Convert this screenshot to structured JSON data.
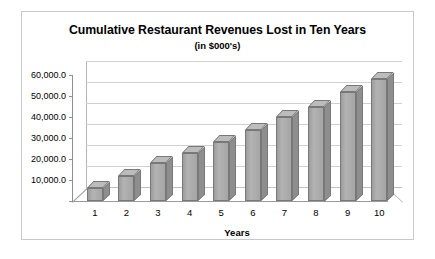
{
  "chart_data": {
    "type": "bar",
    "title": "Cumulative Restaurant Revenues Lost in Ten Years",
    "subtitle": "(in $000's)",
    "xlabel": "Years",
    "ylabel": "",
    "categories": [
      "1",
      "2",
      "3",
      "4",
      "5",
      "6",
      "7",
      "8",
      "9",
      "10"
    ],
    "values": [
      6000,
      12000,
      18000,
      23000,
      28000,
      34000,
      40000,
      45000,
      52000,
      58000
    ],
    "ylim": [
      0,
      60000
    ],
    "ytick_values": [
      10000,
      20000,
      30000,
      40000,
      50000,
      60000
    ],
    "ytick_labels": [
      "10,000.0",
      "20,000.0",
      "30,000.0",
      "40,000.0",
      "50,000.0",
      "60,000.0"
    ],
    "grid": true,
    "legend": false,
    "style": "3d-column",
    "series": [
      {
        "name": "Cumulative Revenues Lost",
        "values": [
          6000,
          12000,
          18000,
          23000,
          28000,
          34000,
          40000,
          45000,
          52000,
          58000
        ]
      }
    ],
    "colors": {
      "bar_front": "#a8a8a8",
      "bar_top": "#bcbcbc",
      "bar_side": "#8e8e8e",
      "bar_border": "#787878",
      "gridline": "#d0d0d0",
      "axis": "#8f8f8f",
      "frame": "#c9c9c9",
      "background": "#ffffff",
      "text": "#000000"
    }
  }
}
